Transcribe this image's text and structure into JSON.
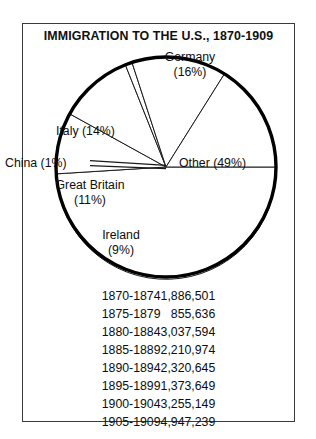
{
  "chart_title": "IMMIGRATION TO THE U.S., 1870-1909",
  "chart_data": {
    "type": "pie",
    "title": "IMMIGRATION TO THE U.S., 1870-1909",
    "xlabel": "",
    "ylabel": "",
    "legend_position": "none",
    "grid": false,
    "categories": [
      "Other",
      "Ireland",
      "Great Britain",
      "China",
      "Italy",
      "Germany"
    ],
    "values": [
      49,
      9,
      11,
      1,
      14,
      16
    ],
    "unit": "percent",
    "slices": [
      {
        "name": "Other",
        "percent": 49,
        "label": "Other (49%)",
        "label_lines": [
          "Other (49%)"
        ]
      },
      {
        "name": "Ireland",
        "percent": 9,
        "label": "Ireland (9%)",
        "label_lines": [
          "Ireland",
          "(9%)"
        ]
      },
      {
        "name": "Great Britain",
        "percent": 11,
        "label": "Great Britain (11%)",
        "label_lines": [
          "Great Britain",
          "(11%)"
        ]
      },
      {
        "name": "China",
        "percent": 1,
        "label": "China (1%)",
        "label_lines": [
          "China (1%)"
        ]
      },
      {
        "name": "Italy",
        "percent": 14,
        "label": "Italy (14%)",
        "label_lines": [
          "Italy (14%)"
        ]
      },
      {
        "name": "Germany",
        "percent": 16,
        "label": "Germany (16%)",
        "label_lines": [
          "Germany",
          "(16%)"
        ]
      }
    ],
    "table": {
      "columns": [
        "Period",
        "Immigrants"
      ],
      "rows": [
        {
          "period": "1870-1874",
          "count": "1,886,501"
        },
        {
          "period": "1875-1879",
          "count": "855,636"
        },
        {
          "period": "1880-1884",
          "count": "3,037,594"
        },
        {
          "period": "1885-1889",
          "count": "2,210,974"
        },
        {
          "period": "1890-1894",
          "count": "2,320,645"
        },
        {
          "period": "1895-1899",
          "count": "1,373,649"
        },
        {
          "period": "1900-1904",
          "count": "3,255,149"
        },
        {
          "period": "1905-1909",
          "count": "4,947,239"
        }
      ]
    }
  },
  "pie_labels": {
    "germany_name": "Germany",
    "germany_pct": "(16%)",
    "italy": "Italy (14%)",
    "china": "China (1%)",
    "great_britain_name": "Great Britain",
    "great_britain_pct": "(11%)",
    "ireland_name": "Ireland",
    "ireland_pct": "(9%)",
    "other": "Other (49%)"
  },
  "colors": {
    "outline": "#000000",
    "slice_fill": "#ffffff",
    "separator": "#1a1a1a",
    "frame": "#3a3a3a",
    "text": "#0d0d0d"
  }
}
